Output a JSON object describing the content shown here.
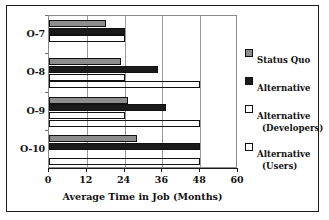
{
  "chart_data": {
    "type": "bar",
    "orientation": "horizontal",
    "title": "",
    "xlabel": "Average Time in Job (Months)",
    "ylabel": "",
    "categories": [
      "O-7",
      "O-8",
      "O-9",
      "O-10"
    ],
    "xlim": [
      0,
      60
    ],
    "xticks": [
      0,
      12,
      24,
      36,
      48,
      60
    ],
    "grid": true,
    "legend_position": "right",
    "series": [
      {
        "name": "Status Quo",
        "values": [
          18,
          23,
          25,
          28
        ],
        "color": "#8d8d8d",
        "pattern": "solid-gray"
      },
      {
        "name": "Alternative",
        "values": [
          24,
          34.5,
          37,
          48
        ],
        "color": "#1a1a1a",
        "pattern": "solid-black"
      },
      {
        "name": "Alternative (Developers)",
        "values": [
          24,
          24,
          24,
          0
        ],
        "color": "#ffffff",
        "pattern": "diagonal-hatch"
      },
      {
        "name": "Alternative (Users)",
        "values": [
          0,
          48,
          48,
          48
        ],
        "color": "#9a9a9a",
        "pattern": "vertical-stripes"
      }
    ]
  },
  "legend": {
    "items": [
      {
        "label": "Status Quo",
        "sublabel": ""
      },
      {
        "label": "Alternative",
        "sublabel": ""
      },
      {
        "label": "Alternative",
        "sublabel": "(Developers)"
      },
      {
        "label": "Alternative",
        "sublabel": "(Users)"
      }
    ]
  }
}
